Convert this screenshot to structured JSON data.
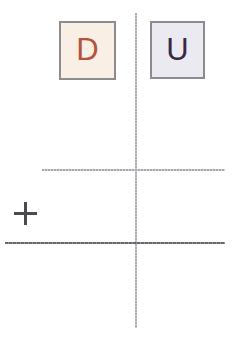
{
  "worksheet": {
    "background_color": "#ffffff",
    "width": 238,
    "height": 344
  },
  "columns": [
    {
      "key": "tens",
      "label": "D",
      "fill_color": "#faefe4",
      "text_color": "#b4533d",
      "border_color": "#8b8b90"
    },
    {
      "key": "ones",
      "label": "U",
      "fill_color": "#eceaf1",
      "text_color": "#3b2742",
      "border_color": "#8b8b90"
    }
  ],
  "operator": {
    "symbol": "+",
    "color": "#4b4b4f"
  },
  "rules": {
    "column_divider": {
      "color": "#a9a9b0",
      "style": "dotted-vertical"
    },
    "addend_separator": {
      "color": "#a8a8ae",
      "style": "dotted-horizontal"
    },
    "sum_line": {
      "color": "#66666b",
      "style": "solid-horizontal"
    }
  }
}
